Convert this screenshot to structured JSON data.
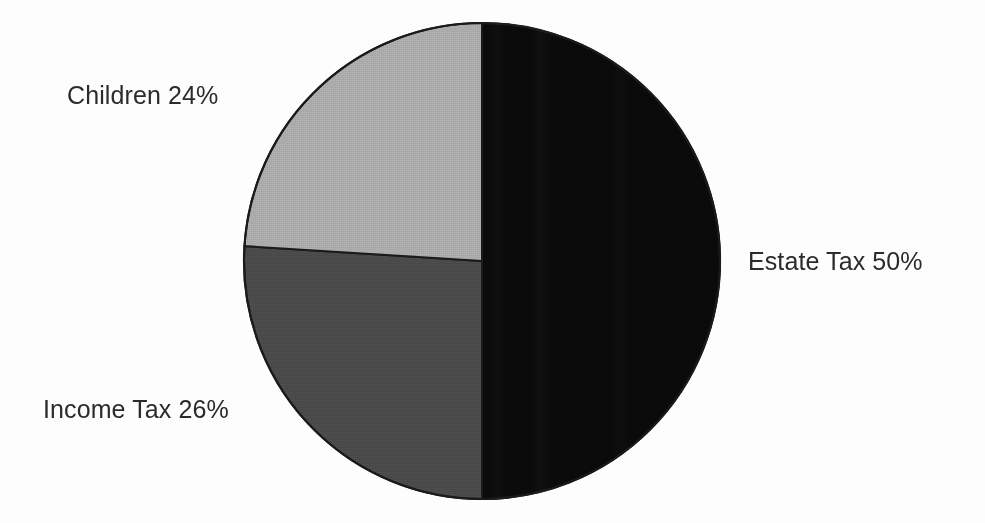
{
  "chart_data": {
    "type": "pie",
    "title": "",
    "subtitle": "",
    "xlabel": "",
    "ylabel": "",
    "legend_position": "none",
    "grid": false,
    "labels_inline": true,
    "unit": "%",
    "total": 100,
    "categories": [
      "Estate Tax",
      "Income Tax",
      "Children"
    ],
    "values": [
      50,
      26,
      24
    ],
    "slices": [
      {
        "name": "Estate Tax",
        "value": 50,
        "label": "Estate Tax 50%",
        "color": "#0a0a0a",
        "start_angle_deg": 0,
        "end_angle_deg": 180,
        "label_position": "right"
      },
      {
        "name": "Income Tax",
        "value": 26,
        "label": "Income Tax 26%",
        "color": "#4a4a4a",
        "start_angle_deg": 180,
        "end_angle_deg": 273.6,
        "label_position": "lower-left"
      },
      {
        "name": "Children",
        "value": 24,
        "label": "Children 24%",
        "color": "#ababab",
        "start_angle_deg": 273.6,
        "end_angle_deg": 360,
        "label_position": "upper-left"
      }
    ],
    "annotations": []
  },
  "figure": {
    "background_color": "#fdfdfd",
    "text_color": "#2b2b2b",
    "outline_color": "#1a1a1a"
  }
}
